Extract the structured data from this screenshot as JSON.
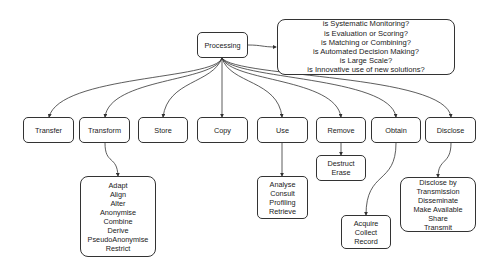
{
  "root": {
    "label": "Processing"
  },
  "criteria": {
    "lines": [
      "is Systematic Monitoring?",
      "is Evaluation or Scoring?",
      "is Matching or Combining?",
      "is Automated Decision Making?",
      "is Large Scale?",
      "is Innovative use of new solutions?"
    ]
  },
  "operations": [
    {
      "label": "Transfer"
    },
    {
      "label": "Transform"
    },
    {
      "label": "Store"
    },
    {
      "label": "Copy"
    },
    {
      "label": "Use"
    },
    {
      "label": "Remove"
    },
    {
      "label": "Obtain"
    },
    {
      "label": "Disclose"
    }
  ],
  "details": {
    "transform": [
      "Adapt",
      "Align",
      "Alter",
      "Anonymise",
      "Combine",
      "Derive",
      "PseudoAnonymise",
      "Restrict"
    ],
    "use": [
      "Analyse",
      "Consult",
      "Profiling",
      "Retrieve"
    ],
    "remove": [
      "Destruct",
      "Erase"
    ],
    "obtain": [
      "Acquire",
      "Collect",
      "Record"
    ],
    "disclose": [
      "Disclose by",
      "Transmission",
      "Disseminate",
      "Make Available",
      "Share",
      "Transmit"
    ]
  }
}
